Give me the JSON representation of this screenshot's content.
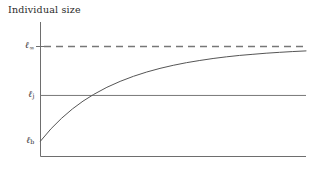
{
  "chart_data": {
    "type": "line",
    "title": "",
    "xlabel": "Individual age",
    "ylabel": "Individual size",
    "grid": false,
    "legend": "none",
    "axis_ticks_x": [],
    "axis_ticks_y": [
      "ℓ",
      "ℓ",
      "ℓ"
    ],
    "y_tick_labels": [
      {
        "base": "ℓ",
        "sub": "∞",
        "value": 1.0
      },
      {
        "base": "ℓ",
        "sub": "j",
        "value": 0.555
      },
      {
        "base": "ℓ",
        "sub": "b",
        "value": 0.14
      }
    ],
    "xlim": [
      0,
      1
    ],
    "ylim": [
      0,
      1.18
    ],
    "series": [
      {
        "name": "von Bertalanffy growth",
        "style": "solid",
        "color": "#555555",
        "x": [
          0.0,
          0.04,
          0.08,
          0.12,
          0.16,
          0.2,
          0.25,
          0.3,
          0.35,
          0.4,
          0.45,
          0.5,
          0.55,
          0.6,
          0.65,
          0.7,
          0.75,
          0.8,
          0.85,
          0.9,
          0.95,
          1.0
        ],
        "y": [
          0.14,
          0.253,
          0.349,
          0.432,
          0.503,
          0.564,
          0.629,
          0.683,
          0.729,
          0.768,
          0.801,
          0.829,
          0.853,
          0.873,
          0.891,
          0.906,
          0.919,
          0.929,
          0.939,
          0.947,
          0.954,
          0.96
        ]
      }
    ],
    "reference_lines": [
      {
        "name": "asymptotic-size",
        "label": "ℓ∞",
        "y": 1.0,
        "style": "dashed",
        "color": "#777777"
      },
      {
        "name": "juvenile-size",
        "label": "ℓj",
        "y": 0.555,
        "style": "solid",
        "color": "#777777"
      }
    ],
    "annotations": []
  },
  "labels": {
    "y_axis_title": "Individual size",
    "x_axis_title": "Individual age"
  },
  "ticks": {
    "l_infinity": {
      "base": "ℓ",
      "sub": "∞"
    },
    "l_j": {
      "base": "ℓ",
      "sub": "j"
    },
    "l_b": {
      "base": "ℓ",
      "sub": "b"
    }
  },
  "colors": {
    "background": "#ffffff",
    "axis": "#6e6e6e",
    "curve": "#555555",
    "dashed_reference": "#777777",
    "solid_reference": "#777777",
    "text": "#2b2b2b"
  }
}
